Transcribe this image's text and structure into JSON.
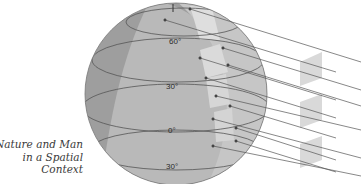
{
  "caption": {
    "lines": [
      "Nature and Man",
      "in a Spatial",
      "Context"
    ]
  },
  "globe": {
    "latitude_labels": [
      {
        "label": "60°",
        "x": 176,
        "y": 44
      },
      {
        "label": "30°",
        "x": 173,
        "y": 88
      },
      {
        "label": "0°",
        "x": 172,
        "y": 132
      },
      {
        "label": "30°",
        "x": 172,
        "y": 168
      }
    ],
    "colors": {
      "shadow": "#9a9a9a",
      "lit": "#bdbdbd",
      "highlight": "#dcdcdc",
      "outline": "#555555",
      "rays": "#555555",
      "cross_section": "#d9d9d9"
    }
  },
  "rays": {
    "count": 12,
    "cross_sections": 3
  }
}
